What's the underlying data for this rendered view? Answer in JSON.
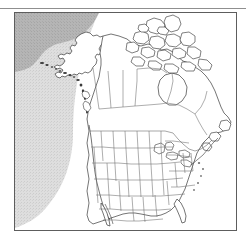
{
  "figure": {
    "type": "map",
    "region_title": "North America",
    "frame": {
      "visible": true,
      "border_color": "#5d5d5d"
    },
    "top_rule": {
      "visible": true,
      "color": "#8f8f8f"
    }
  },
  "map": {
    "projection_look": "conic, north-america-centered",
    "background_color": "#ffffff",
    "land_fill": "#ffffff",
    "coastline_color": "#3a3a3a",
    "internal_border_color": "#6b6b6b",
    "shading": [
      {
        "name": "pacific-ocean-shading",
        "label": "Pacific Ocean shaded area",
        "color": "#dcdcdc",
        "description": "Light stippled gray covering the western/left portion of the map with a curved eastern boundary"
      },
      {
        "name": "arctic-bering-shading",
        "label": "Arctic / Bering Sea shaded area",
        "color": "#b3b3b3",
        "description": "Darker gray band north and west of Alaska"
      }
    ],
    "features": [
      {
        "name": "alaska",
        "label": "Alaska"
      },
      {
        "name": "canada",
        "label": "Canada"
      },
      {
        "name": "arctic-archipelago",
        "label": "Canadian Arctic Archipelago"
      },
      {
        "name": "hudson-bay",
        "label": "Hudson Bay"
      },
      {
        "name": "great-lakes",
        "label": "Great Lakes"
      },
      {
        "name": "united-states",
        "label": "Contiguous United States"
      },
      {
        "name": "florida-peninsula",
        "label": "Florida"
      },
      {
        "name": "gulf-of-mexico",
        "label": "Gulf of Mexico"
      },
      {
        "name": "newfoundland",
        "label": "Newfoundland"
      },
      {
        "name": "baja-california",
        "label": "Baja California"
      }
    ],
    "labels": [],
    "legend": null,
    "scale_bar": null,
    "north_arrow": null
  }
}
